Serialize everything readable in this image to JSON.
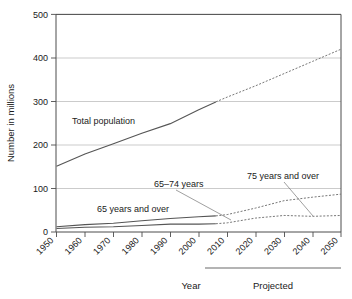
{
  "chart_data": {
    "type": "line",
    "title": "",
    "xlabel": "Year",
    "ylabel": "Number in millions",
    "xlim": [
      1950,
      2050
    ],
    "ylim": [
      0,
      500
    ],
    "yticks": [
      0,
      100,
      200,
      300,
      400,
      500
    ],
    "xticks": [
      1950,
      1960,
      1970,
      1980,
      1990,
      2000,
      2010,
      2020,
      2030,
      2040,
      2050
    ],
    "grid": true,
    "legend_position": "inline-annotations",
    "projection_start_year": 2006,
    "projection_note": "Projected",
    "series": [
      {
        "name": "Total population",
        "x": [
          1950,
          1960,
          1970,
          1980,
          1990,
          2000,
          2006,
          2010,
          2020,
          2030,
          2040,
          2050
        ],
        "values": [
          151,
          179,
          203,
          227,
          249,
          281,
          299,
          310,
          336,
          364,
          392,
          420
        ],
        "style_actual": "solid",
        "style_projected": "dashed"
      },
      {
        "name": "65 years and over",
        "x": [
          1950,
          1960,
          1970,
          1980,
          1990,
          2000,
          2006,
          2010,
          2020,
          2030,
          2040,
          2050
        ],
        "values": [
          12,
          17,
          20,
          26,
          31,
          35,
          37,
          40,
          55,
          72,
          80,
          87
        ],
        "style_actual": "solid",
        "style_projected": "dashed"
      },
      {
        "name": "65–74 years",
        "x": [
          1950,
          1960,
          1970,
          1980,
          1990,
          2000,
          2006,
          2010,
          2020,
          2030,
          2040,
          2050
        ],
        "values": [
          8,
          11,
          12,
          15,
          18,
          18,
          19,
          21,
          32,
          38,
          36,
          38
        ],
        "style_actual": "solid",
        "style_projected": "dashed"
      }
    ],
    "annotations": [
      {
        "label": "Total population",
        "x_px": 72,
        "y_px": 124
      },
      {
        "label": "65 years and over",
        "x_px": 97,
        "y_px": 211
      },
      {
        "label": "65–74 years",
        "x_px": 155,
        "y_px": 186
      },
      {
        "label": "75 years and over",
        "x_px": 248,
        "y_px": 178
      },
      {
        "label": "Year",
        "x_px": 178,
        "y_px": 289
      },
      {
        "label": "Projected",
        "x_px": 251,
        "y_px": 289
      }
    ],
    "colors": {
      "line_actual": "#555555",
      "line_projected": "#777777",
      "grid": "#b4b4b4",
      "frame": "#4d4d4d",
      "text": "#1a1a1a",
      "background": "#ffffff"
    }
  },
  "axes": {
    "y_title": "Number in millions",
    "x_title": "Year",
    "y_tick_labels": [
      "500",
      "400",
      "300",
      "200",
      "100",
      "0"
    ],
    "x_tick_labels": [
      "1950",
      "1960",
      "1970",
      "1980",
      "1990",
      "2000",
      "2010",
      "2020",
      "2030",
      "2040",
      "2050"
    ]
  },
  "labels": {
    "total_population": "Total population",
    "sixtyfive_and_over": "65 years and over",
    "sixtyfive_to_74": "65–74 years",
    "seventyfive_and_over": "75 years and over",
    "projected": "Projected"
  }
}
